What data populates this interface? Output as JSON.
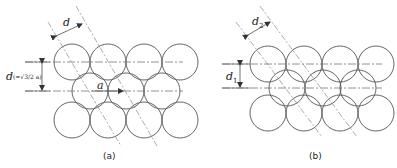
{
  "panels": [
    {
      "id": "a",
      "caption": "(a)",
      "spacing_label": "d",
      "row_gap_label": "d",
      "row_gap_formula": "(=√3/2 a)",
      "neighbor_label": "a",
      "rows": [
        {
          "y": 62,
          "xs": [
            72,
            108,
            144,
            180
          ]
        },
        {
          "y": 91,
          "xs": [
            90,
            126,
            162
          ]
        },
        {
          "y": 120,
          "xs": [
            72,
            108,
            144,
            180
          ]
        }
      ],
      "radius": 18
    },
    {
      "id": "b",
      "caption": "(b)",
      "spacing_label": "d",
      "spacing_sub": "2",
      "row_gap_label": "d",
      "row_gap_sub": "1",
      "rows": [
        {
          "y": 64,
          "xs": [
            268,
            304,
            340,
            376
          ]
        },
        {
          "y": 88,
          "xs": [
            287,
            323,
            358
          ]
        },
        {
          "y": 113,
          "xs": [
            268,
            304,
            340,
            376
          ]
        }
      ],
      "radius": 18
    }
  ]
}
